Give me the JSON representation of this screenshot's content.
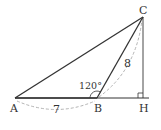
{
  "diagram": {
    "type": "triangle-geometry",
    "points": {
      "A": {
        "label": "A",
        "x": 15,
        "y": 98
      },
      "B": {
        "label": "B",
        "x": 97,
        "y": 98
      },
      "C": {
        "label": "C",
        "x": 143,
        "y": 17
      },
      "H": {
        "label": "H",
        "x": 143,
        "y": 98
      }
    },
    "labels": {
      "angle_B": "120°",
      "side_AB": "7",
      "side_BC": "8"
    },
    "colors": {
      "stroke": "#333333",
      "dashed": "#aaaaaa"
    }
  }
}
